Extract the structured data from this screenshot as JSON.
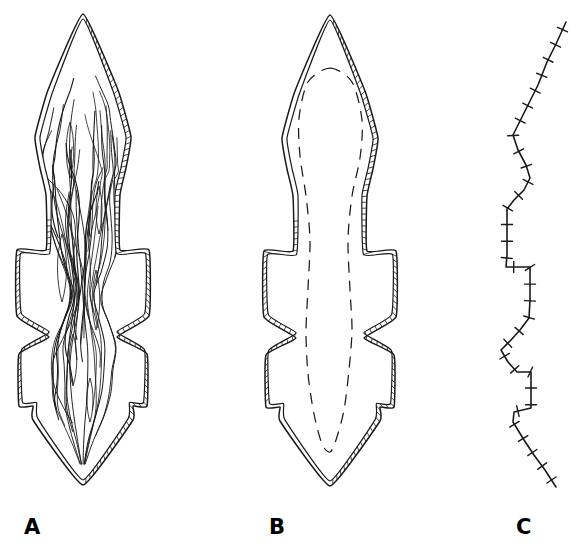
{
  "figure": {
    "background_color": "#ffffff",
    "line_color": "#1a1a1a",
    "width": 588,
    "height": 553,
    "caption_labels": [
      {
        "id": "A",
        "text": "A",
        "x": 24,
        "y": 517
      },
      {
        "id": "B",
        "text": "B",
        "x": 269,
        "y": 517
      },
      {
        "id": "C",
        "text": "C",
        "x": 516,
        "y": 517
      }
    ]
  },
  "chart_data": {
    "type": "diagram",
    "title": "",
    "panels": [
      {
        "id": "A",
        "label": "A",
        "content": "lens outline with internal anastomosing foliation traces",
        "outline_style": "double-line-with-ladder-hatching",
        "interior_lines": "wavy anastomosing foliation",
        "bbox": {
          "x": 14,
          "y": 13,
          "w": 140,
          "h": 474
        }
      },
      {
        "id": "B",
        "label": "B",
        "content": "same lens outline with a single closed dashed internal contour",
        "outline_style": "double-line-with-ladder-hatching",
        "interior_lines": "dashed closed contour",
        "bbox": {
          "x": 260,
          "y": 13,
          "w": 142,
          "h": 476
        }
      },
      {
        "id": "C",
        "label": "C",
        "content": "single polyline with perpendicular tick marks",
        "outline_style": "ticked-line",
        "interior_lines": "none",
        "bbox": {
          "x": 498,
          "y": 22,
          "w": 70,
          "h": 465
        }
      }
    ],
    "outline_vertices_A": [
      [
        83,
        14
      ],
      [
        118,
        90
      ],
      [
        131,
        137
      ],
      [
        126,
        168
      ],
      [
        120,
        195
      ],
      [
        120,
        250
      ],
      [
        149,
        250
      ],
      [
        149,
        316
      ],
      [
        117,
        337
      ],
      [
        147,
        354
      ],
      [
        147,
        406
      ],
      [
        133,
        406
      ],
      [
        133,
        420
      ],
      [
        83,
        485
      ],
      [
        33,
        420
      ],
      [
        33,
        406
      ],
      [
        19,
        406
      ],
      [
        19,
        354
      ],
      [
        49,
        337
      ],
      [
        17,
        316
      ],
      [
        17,
        250
      ],
      [
        46,
        250
      ],
      [
        46,
        195
      ],
      [
        40,
        168
      ],
      [
        35,
        137
      ],
      [
        48,
        90
      ]
    ],
    "outline_vertices_B": [
      [
        330,
        15
      ],
      [
        365,
        91
      ],
      [
        378,
        138
      ],
      [
        373,
        169
      ],
      [
        367,
        196
      ],
      [
        367,
        251
      ],
      [
        396,
        251
      ],
      [
        396,
        317
      ],
      [
        364,
        338
      ],
      [
        394,
        355
      ],
      [
        394,
        407
      ],
      [
        380,
        407
      ],
      [
        380,
        421
      ],
      [
        330,
        486
      ],
      [
        280,
        421
      ],
      [
        280,
        407
      ],
      [
        266,
        407
      ],
      [
        266,
        355
      ],
      [
        296,
        338
      ],
      [
        264,
        317
      ],
      [
        264,
        251
      ],
      [
        293,
        251
      ],
      [
        293,
        196
      ],
      [
        287,
        169
      ],
      [
        282,
        138
      ],
      [
        295,
        91
      ]
    ],
    "ticked_line_C": {
      "vertices": [
        [
          566,
          22
        ],
        [
          556,
          44
        ],
        [
          547,
          62
        ],
        [
          538,
          85
        ],
        [
          528,
          105
        ],
        [
          519,
          123
        ],
        [
          513,
          135
        ],
        [
          518,
          150
        ],
        [
          526,
          165
        ],
        [
          530,
          178
        ],
        [
          524,
          190
        ],
        [
          514,
          200
        ],
        [
          507,
          209
        ],
        [
          507,
          225
        ],
        [
          507,
          240
        ],
        [
          507,
          255
        ],
        [
          506,
          267
        ],
        [
          530,
          267
        ],
        [
          530,
          285
        ],
        [
          530,
          300
        ],
        [
          529,
          318
        ],
        [
          520,
          330
        ],
        [
          511,
          340
        ],
        [
          501,
          350
        ],
        [
          508,
          362
        ],
        [
          517,
          372
        ],
        [
          531,
          372
        ],
        [
          531,
          390
        ],
        [
          531,
          408
        ],
        [
          514,
          412
        ],
        [
          513,
          422
        ],
        [
          524,
          440
        ],
        [
          534,
          455
        ],
        [
          545,
          470
        ],
        [
          556,
          487
        ]
      ],
      "tick_count": 34,
      "tick_length": 11
    }
  }
}
